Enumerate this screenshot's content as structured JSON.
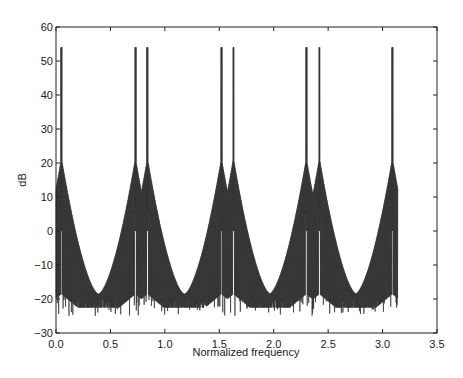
{
  "chart_data": {
    "type": "line",
    "title": "",
    "xlabel": "Normalized frequency",
    "ylabel": "dB",
    "xlim": [
      0.0,
      3.5
    ],
    "ylim": [
      -30,
      60
    ],
    "xticks": [
      "0.0",
      "0.5",
      "1.0",
      "1.5",
      "2.0",
      "2.5",
      "3.0",
      "3.5"
    ],
    "yticks": [
      "60",
      "50",
      "40",
      "30",
      "20",
      "10",
      "0",
      "-10",
      "-20",
      "-30"
    ],
    "grid": false,
    "legend": null,
    "line_color": "#333333",
    "data_x_range": [
      0.0,
      3.14
    ],
    "peaks": [
      {
        "x": 0.05,
        "y": 54
      },
      {
        "x": 0.73,
        "y": 54
      },
      {
        "x": 0.84,
        "y": 54
      },
      {
        "x": 1.52,
        "y": 54
      },
      {
        "x": 1.63,
        "y": 54
      },
      {
        "x": 2.3,
        "y": 54
      },
      {
        "x": 2.42,
        "y": 54
      },
      {
        "x": 3.09,
        "y": 54
      }
    ],
    "troughs_convergence": [
      {
        "x": 0.39,
        "y": -18.5
      },
      {
        "x": 1.18,
        "y": -18.5
      },
      {
        "x": 1.96,
        "y": -18.5
      },
      {
        "x": 2.75,
        "y": -18.5
      }
    ],
    "noise_floor_min": -25
  }
}
